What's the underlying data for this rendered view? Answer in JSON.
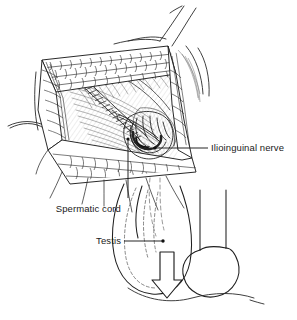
{
  "figure": {
    "background_color": "#ffffff",
    "line_color": "#1a1a1a",
    "shade_color": "#9a9a9a"
  },
  "labels": {
    "ilioinguinal_nerve": "Ilioinguinal nerve",
    "spermatic_cord": "Spermatic cord",
    "testis": "Testis"
  },
  "annotations": {
    "descent_arrow": "downward-arrow",
    "nerve_marker": "dot-marker",
    "testis_marker": "dot-marker"
  }
}
